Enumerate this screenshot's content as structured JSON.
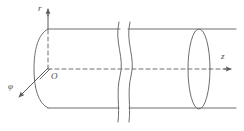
{
  "figure": {
    "type": "line-diagram",
    "background_color": "#ffffff",
    "stroke_color": "#6e6e6e",
    "label_color": "#4a4a4a",
    "width": 244,
    "height": 131
  },
  "labels": {
    "radial_axis": "r",
    "axial_axis": "z",
    "azimuthal_axis": "φ",
    "origin": "O"
  },
  "geometry": {
    "cylinder": {
      "top_line_y": 29,
      "bottom_line_y": 108,
      "left_x": 48,
      "right_x": 236
    },
    "axis_origin": {
      "x": 48,
      "y": 69
    },
    "r_axis": {
      "from_y": 69,
      "to_y": 8,
      "x": 48
    },
    "z_axis": {
      "from_x": 48,
      "to_x": 232,
      "y": 69
    },
    "phi_arrow": {
      "from_x": 48,
      "from_y": 68,
      "to_x": 19,
      "to_y": 97
    },
    "right_ellipse": {
      "cx": 199,
      "cy": 69,
      "rx": 11,
      "ry": 40
    },
    "left_cap_arc": {
      "cx": 48,
      "cy": 69,
      "rx": 13,
      "ry": 40
    },
    "break_lines_x": [
      118,
      129
    ]
  }
}
